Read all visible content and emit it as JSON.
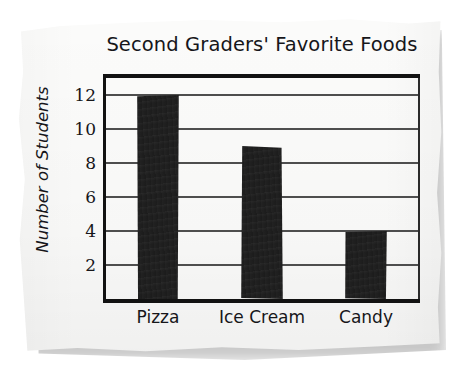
{
  "chart_data": {
    "type": "bar",
    "title": "Second Graders' Favorite Foods",
    "xlabel": "",
    "ylabel": "Number of Students",
    "categories": [
      "Pizza",
      "Ice Cream",
      "Candy"
    ],
    "values": [
      12,
      9,
      4
    ],
    "ylim": [
      0,
      13
    ],
    "yticks": [
      2,
      4,
      6,
      8,
      10,
      12
    ],
    "ytick_labels": [
      "2",
      "4",
      "6",
      "8",
      "10",
      "12"
    ],
    "grid": "horizontal",
    "legend": "none",
    "bar_color": "#1c1c1c",
    "background_color": "#fbfbfa",
    "axis_color": "#121212",
    "gridline_color": "#4e4e4e"
  },
  "media": {
    "style": "hand-drawn chart on torn paper, scanned",
    "shadow_color": "#9a9a9a"
  }
}
